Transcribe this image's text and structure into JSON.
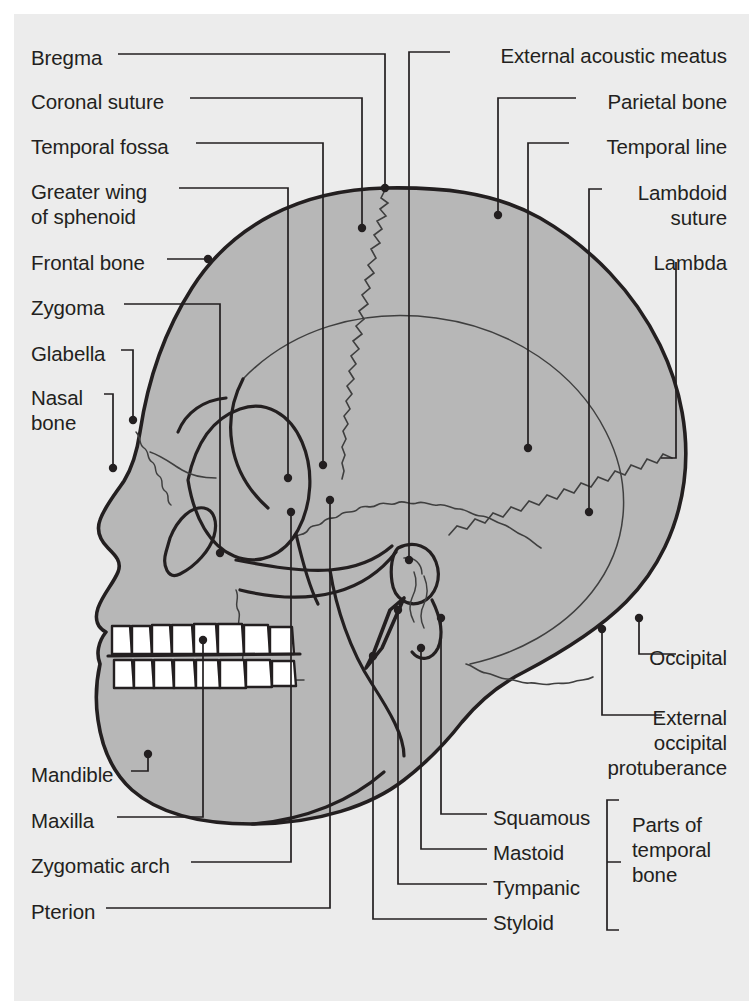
{
  "figure": {
    "view": "left lateral (norma lateralis)",
    "colors": {
      "page_background": "#ffffff",
      "plate_background": "#ececec",
      "bone_fill": "#b7b7b7",
      "tooth_fill": "#ffffff",
      "outline": "#231f20",
      "suture_line": "#3a3a3a",
      "leader_line": "#231f20",
      "label_text": "#231f20"
    }
  },
  "labels_left": [
    {
      "id": "bregma",
      "text": "Bregma",
      "x": 31,
      "y": 45
    },
    {
      "id": "coronal-suture",
      "text": "Coronal suture",
      "x": 31,
      "y": 89
    },
    {
      "id": "temporal-fossa",
      "text": "Temporal fossa",
      "x": 31,
      "y": 134
    },
    {
      "id": "greater-wing",
      "text": "Greater wing\nof sphenoid",
      "x": 31,
      "y": 179
    },
    {
      "id": "frontal-bone",
      "text": "Frontal bone",
      "x": 31,
      "y": 250
    },
    {
      "id": "zygoma",
      "text": "Zygoma",
      "x": 31,
      "y": 295
    },
    {
      "id": "glabella",
      "text": "Glabella",
      "x": 31,
      "y": 341
    },
    {
      "id": "nasal-bone",
      "text": "Nasal\nbone",
      "x": 31,
      "y": 385
    },
    {
      "id": "mandible",
      "text": "Mandible",
      "x": 31,
      "y": 762
    },
    {
      "id": "maxilla",
      "text": "Maxilla",
      "x": 31,
      "y": 808
    },
    {
      "id": "zygomatic-arch",
      "text": "Zygomatic arch",
      "x": 31,
      "y": 853
    },
    {
      "id": "pterion",
      "text": "Pterion",
      "x": 31,
      "y": 899
    }
  ],
  "labels_right": [
    {
      "id": "external-acoustic-meatus",
      "text": "External acoustic meatus",
      "x": 727,
      "y": 43
    },
    {
      "id": "parietal-bone",
      "text": "Parietal bone",
      "x": 727,
      "y": 89
    },
    {
      "id": "temporal-line",
      "text": "Temporal line",
      "x": 727,
      "y": 134
    },
    {
      "id": "lambdoid-suture",
      "text": "Lambdoid\nsuture",
      "x": 727,
      "y": 180
    },
    {
      "id": "lambda",
      "text": "Lambda",
      "x": 727,
      "y": 250
    },
    {
      "id": "occipital",
      "text": "Occipital",
      "x": 727,
      "y": 645
    },
    {
      "id": "external-occipital-protuberance",
      "text": "External\noccipital\nprotuberance",
      "x": 727,
      "y": 705
    },
    {
      "id": "squamous",
      "text": "Squamous",
      "x": 597,
      "y": 805
    },
    {
      "id": "mastoid",
      "text": "Mastoid",
      "x": 597,
      "y": 840
    },
    {
      "id": "tympanic",
      "text": "Tympanic",
      "x": 597,
      "y": 875
    },
    {
      "id": "styloid",
      "text": "Styloid",
      "x": 597,
      "y": 910
    },
    {
      "id": "parts-of-temporal-bone",
      "text": "Parts of\ntemporal\nbone",
      "x": 727,
      "y": 812
    }
  ],
  "bracket": {
    "id": "temporal-parts-bracket",
    "label_ref": "parts-of-temporal-bone",
    "groups": [
      "Squamous",
      "Mastoid",
      "Tympanic",
      "Styloid"
    ]
  },
  "anatomy_points": {
    "bregma": "skull vertex, junction of coronal and sagittal sutures",
    "coronal_suture": "zigzag suture descending from bregma",
    "lambda": "junction of sagittal and lambdoid sutures, posterior",
    "pterion": "H-shaped junction: frontal, parietal, sphenoid, temporal"
  }
}
